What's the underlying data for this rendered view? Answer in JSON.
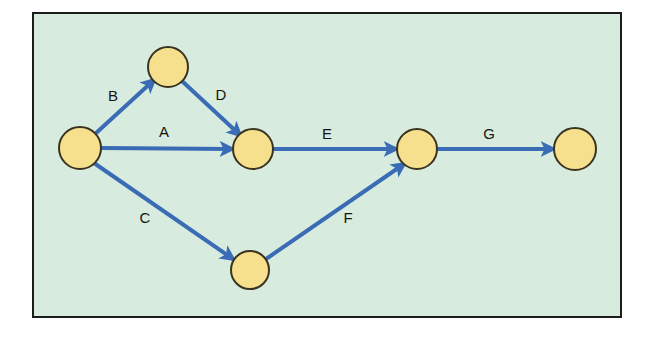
{
  "figure": {
    "type": "directed-graph",
    "canvas": {
      "width": 656,
      "height": 338
    }
  },
  "frame": {
    "x": 32,
    "y": 12,
    "width": 590,
    "height": 306,
    "fill": "#d7ebdf",
    "stroke": "#1c1c1c",
    "stroke_width": 2
  },
  "style": {
    "node_fill": "#f6e08e",
    "node_stroke": "#3a3320",
    "node_stroke_width": 2,
    "edge_color": "#3a6cb5",
    "edge_width": 4,
    "label_color": "#16160f",
    "label_size": 15
  },
  "nodes": [
    {
      "id": "n1",
      "label": "",
      "cx": 80,
      "cy": 148,
      "rx": 21,
      "ry": 21
    },
    {
      "id": "n2",
      "label": "",
      "cx": 168,
      "cy": 67,
      "rx": 20,
      "ry": 20
    },
    {
      "id": "n3",
      "label": "",
      "cx": 253,
      "cy": 149,
      "rx": 20,
      "ry": 20
    },
    {
      "id": "n4",
      "label": "",
      "cx": 250,
      "cy": 270,
      "rx": 19,
      "ry": 19
    },
    {
      "id": "n5",
      "label": "",
      "cx": 417,
      "cy": 149,
      "rx": 20,
      "ry": 20
    },
    {
      "id": "n6",
      "label": "",
      "cx": 575,
      "cy": 149,
      "rx": 21,
      "ry": 21
    }
  ],
  "edges": [
    {
      "id": "e_B",
      "label": "B",
      "from": "n1",
      "to": "n2",
      "x1": 95,
      "y1": 134,
      "x2": 154,
      "y2": 80,
      "label_x": 113,
      "label_y": 97
    },
    {
      "id": "e_A",
      "label": "A",
      "from": "n1",
      "to": "n3",
      "x1": 101,
      "y1": 148,
      "x2": 232,
      "y2": 149,
      "label_x": 164,
      "label_y": 133
    },
    {
      "id": "e_D",
      "label": "D",
      "from": "n2",
      "to": "n3",
      "x1": 182,
      "y1": 81,
      "x2": 240,
      "y2": 135,
      "label_x": 221,
      "label_y": 96
    },
    {
      "id": "e_C",
      "label": "C",
      "from": "n1",
      "to": "n4",
      "x1": 94,
      "y1": 163,
      "x2": 233,
      "y2": 259,
      "label_x": 145,
      "label_y": 219
    },
    {
      "id": "e_E",
      "label": "E",
      "from": "n3",
      "to": "n5",
      "x1": 273,
      "y1": 149,
      "x2": 396,
      "y2": 149,
      "label_x": 327,
      "label_y": 135
    },
    {
      "id": "e_F",
      "label": "F",
      "from": "n4",
      "to": "n5",
      "x1": 266,
      "y1": 259,
      "x2": 404,
      "y2": 164,
      "label_x": 348,
      "label_y": 219
    },
    {
      "id": "e_G",
      "label": "G",
      "from": "n5",
      "to": "n6",
      "x1": 437,
      "y1": 149,
      "x2": 553,
      "y2": 149,
      "label_x": 489,
      "label_y": 135
    }
  ]
}
